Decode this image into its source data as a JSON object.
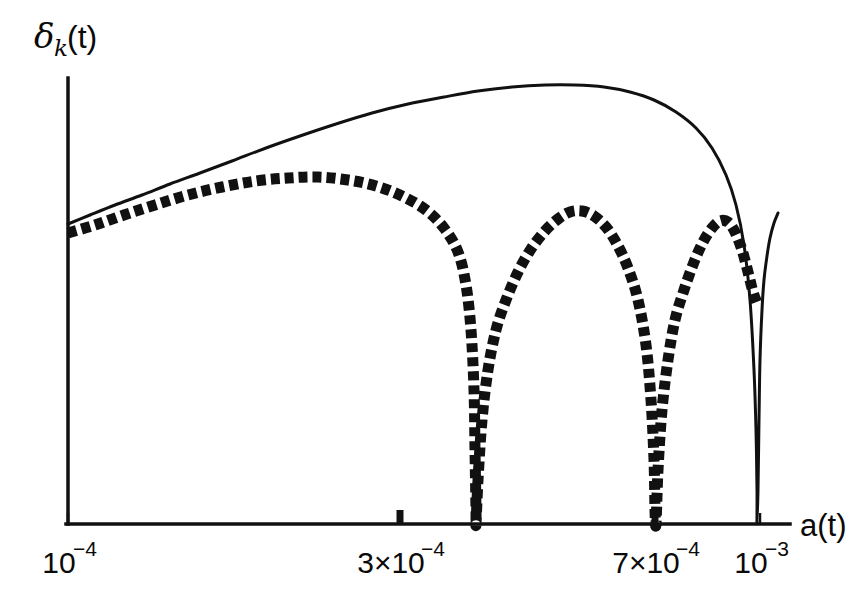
{
  "figure": {
    "background_color": "#ffffff",
    "ink_color": "#111111",
    "width": 866,
    "height": 604
  },
  "chart_data": {
    "type": "line",
    "title": "",
    "xlabel": "a(t)",
    "ylabel": "δ",
    "ylabel_sub": "k",
    "ylabel_tail": "(t)",
    "xscale": "log",
    "yscale": "linear",
    "grid": false,
    "legend": "none",
    "xlim": [
      0.0001,
      0.001
    ],
    "ylim": [
      0,
      1
    ],
    "xticks": [
      {
        "value": 0.0001,
        "label": "10",
        "exponent": "−4",
        "prefix": "",
        "px": 68
      },
      {
        "value": 0.0003,
        "label": "10",
        "exponent": "−4",
        "prefix": "3×",
        "px": 400
      },
      {
        "value": 0.0007,
        "label": "10",
        "exponent": "−4",
        "prefix": "7×",
        "px": 655
      },
      {
        "value": 0.001,
        "label": "10",
        "exponent": "−3",
        "prefix": "",
        "px": 760
      }
    ],
    "ytick_labels": [],
    "series": [
      {
        "name": "growing mode",
        "style": "solid",
        "linewidth": 3,
        "color": "#111111",
        "points_px": [
          [
            68,
            224
          ],
          [
            90,
            215
          ],
          [
            115,
            205
          ],
          [
            142,
            195
          ],
          [
            170,
            184
          ],
          [
            200,
            173
          ],
          [
            232,
            161
          ],
          [
            266,
            148
          ],
          [
            300,
            136
          ],
          [
            336,
            124
          ],
          [
            372,
            113
          ],
          [
            408,
            104
          ],
          [
            444,
            97
          ],
          [
            478,
            91
          ],
          [
            512,
            87
          ],
          [
            545,
            85
          ],
          [
            575,
            85
          ],
          [
            604,
            87
          ],
          [
            630,
            92
          ],
          [
            654,
            100
          ],
          [
            676,
            112
          ],
          [
            696,
            128
          ],
          [
            712,
            148
          ],
          [
            726,
            175
          ],
          [
            736,
            205
          ],
          [
            744,
            245
          ],
          [
            750,
            300
          ],
          [
            754,
            370
          ],
          [
            756,
            430
          ],
          [
            757,
            490
          ],
          [
            757,
            524
          ],
          [
            758,
            490
          ],
          [
            759,
            420
          ],
          [
            760,
            360
          ],
          [
            762,
            310
          ],
          [
            764,
            280
          ],
          [
            767,
            256
          ],
          [
            770,
            238
          ],
          [
            774,
            223
          ],
          [
            778,
            213
          ]
        ]
      },
      {
        "name": "oscillating mode",
        "style": "dotted-square",
        "linewidth": 11,
        "dash_pattern": "9 5",
        "color": "#111111",
        "points_px": [
          [
            68,
            233
          ],
          [
            95,
            225
          ],
          [
            124,
            215
          ],
          [
            155,
            205
          ],
          [
            188,
            195
          ],
          [
            222,
            187
          ],
          [
            256,
            181
          ],
          [
            288,
            178
          ],
          [
            318,
            177
          ],
          [
            348,
            180
          ],
          [
            376,
            186
          ],
          [
            402,
            196
          ],
          [
            426,
            210
          ],
          [
            444,
            228
          ],
          [
            458,
            252
          ],
          [
            466,
            285
          ],
          [
            471,
            330
          ],
          [
            474,
            390
          ],
          [
            475,
            450
          ],
          [
            476,
            510
          ],
          [
            476,
            524
          ],
          [
            478,
            480
          ],
          [
            482,
            420
          ],
          [
            488,
            370
          ],
          [
            496,
            330
          ],
          [
            506,
            300
          ],
          [
            518,
            272
          ],
          [
            531,
            249
          ],
          [
            545,
            231
          ],
          [
            558,
            219
          ],
          [
            570,
            212
          ],
          [
            582,
            211
          ],
          [
            594,
            216
          ],
          [
            606,
            227
          ],
          [
            617,
            244
          ],
          [
            628,
            268
          ],
          [
            638,
            300
          ],
          [
            646,
            345
          ],
          [
            651,
            400
          ],
          [
            654,
            460
          ],
          [
            655,
            510
          ],
          [
            656,
            524
          ],
          [
            658,
            470
          ],
          [
            662,
            410
          ],
          [
            668,
            360
          ],
          [
            675,
            320
          ],
          [
            684,
            290
          ],
          [
            694,
            262
          ],
          [
            703,
            242
          ],
          [
            712,
            228
          ],
          [
            720,
            221
          ],
          [
            728,
            222
          ],
          [
            735,
            232
          ],
          [
            742,
            250
          ],
          [
            748,
            272
          ],
          [
            753,
            292
          ],
          [
            757,
            303
          ]
        ]
      }
    ],
    "annotations": []
  },
  "axes": {
    "x_axis_px": {
      "x1": 68,
      "x2": 790,
      "y": 524
    },
    "y_axis_px": {
      "x": 68,
      "y1": 78,
      "y2": 524
    },
    "tick_length": 9,
    "axis_linewidth": 3
  },
  "labels": {
    "y_axis_title": "δk(t)",
    "x_axis_title": "a(t)"
  }
}
